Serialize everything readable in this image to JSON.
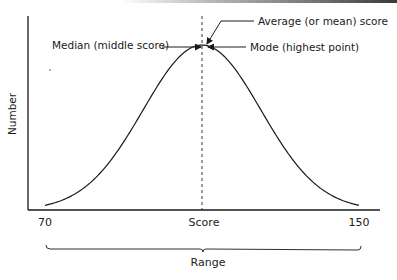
{
  "chart_data": {
    "type": "line",
    "title": "",
    "xlabel": "Score",
    "ylabel": "Number",
    "xlim": [
      70,
      150
    ],
    "x_ticks": [
      {
        "value": 70,
        "label": "70"
      },
      {
        "value": 110,
        "label": "Score"
      },
      {
        "value": 150,
        "label": "150"
      }
    ],
    "series": [
      {
        "name": "Normal distribution",
        "center": 110,
        "spread_sd": 15,
        "x": [
          70,
          80,
          90,
          100,
          105,
          110,
          115,
          120,
          130,
          140,
          150
        ],
        "y_relative": [
          0.0,
          0.05,
          0.22,
          0.64,
          0.89,
          1.0,
          0.89,
          0.64,
          0.22,
          0.05,
          0.0
        ]
      }
    ],
    "reference_line": {
      "x": 110,
      "style": "dashed"
    },
    "annotations": [
      {
        "id": "mean",
        "text": "Average (or mean) score"
      },
      {
        "id": "median",
        "text": "Median (middle score)"
      },
      {
        "id": "mode",
        "text": "Mode (highest point)"
      }
    ],
    "bracket": {
      "from": 70,
      "to": 150,
      "label": "Range"
    },
    "grid": false,
    "legend": "none"
  }
}
